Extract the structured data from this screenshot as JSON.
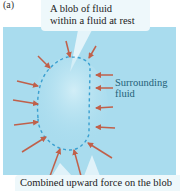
{
  "figure": {
    "panel_label": "(a)",
    "callout_top": {
      "line1": "A blob of fluid",
      "line2": "within a fluid at rest"
    },
    "surrounding_label": {
      "line1": "Surrounding",
      "line2": "fluid"
    },
    "callout_bottom": {
      "text": "Combined upward force on the blob"
    },
    "colors": {
      "fluid": "#a9dcee",
      "callout": "#eef8fb",
      "arrow": "#c0604a",
      "blob_outline": "#3a9fd0",
      "label_text": "#1f5f78"
    }
  }
}
